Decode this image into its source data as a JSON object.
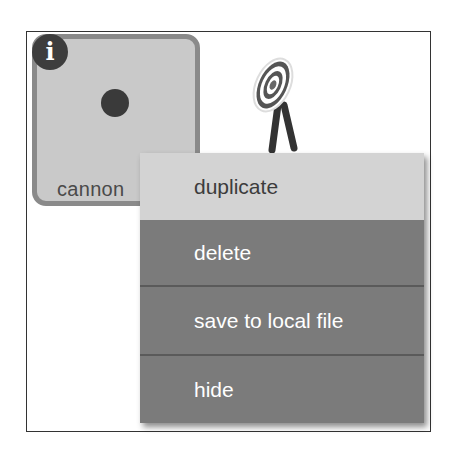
{
  "sprite_pane": {
    "sprites": [
      {
        "name": "cannon",
        "selected": true,
        "info_badge_glyph": "i",
        "icon": "cannon-dot-icon"
      },
      {
        "name": "",
        "selected": false,
        "icon": "target-icon"
      }
    ]
  },
  "context_menu": {
    "items": [
      {
        "label": "duplicate",
        "highlighted": true
      },
      {
        "label": "delete",
        "highlighted": false
      },
      {
        "label": "save to local file",
        "highlighted": false
      },
      {
        "label": "hide",
        "highlighted": false
      }
    ]
  },
  "colors": {
    "tile_bg": "#c9c9c9",
    "tile_border": "#8a8a8a",
    "menu_bg": "#7b7b7b",
    "menu_highlight": "#d3d3d3",
    "menu_text": "#ffffff"
  }
}
